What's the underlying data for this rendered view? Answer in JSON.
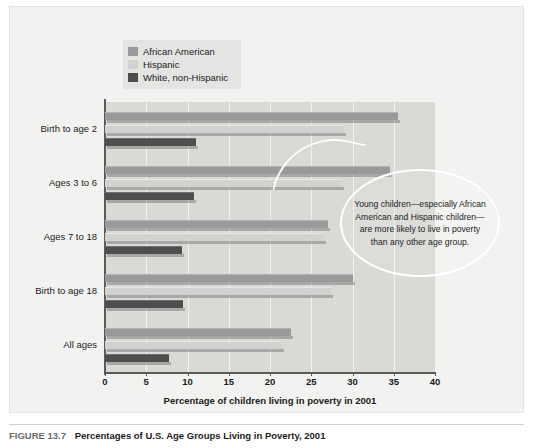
{
  "figure": {
    "caption_label": "FIGURE 13.7",
    "caption_text": "Percentages of U.S. Age Groups Living in Poverty, 2001"
  },
  "callout": {
    "text": "Young children—especially African American and Hispanic children—are more likely to live in poverty than any other age group."
  },
  "chart_data": {
    "type": "bar",
    "orientation": "horizontal",
    "title": "",
    "xlabel": "Percentage of children living in poverty in 2001",
    "ylabel": "",
    "xlim": [
      0,
      40
    ],
    "xticks": [
      0,
      5,
      10,
      15,
      20,
      25,
      30,
      35,
      40
    ],
    "grid": true,
    "legend_position": "top-left",
    "categories": [
      "Birth to age 2",
      "Ages 3 to 6",
      "Ages 7 to 18",
      "Birth to age 18",
      "All ages"
    ],
    "series": [
      {
        "name": "African American",
        "color": "#9a9a9a",
        "values": [
          35.5,
          34.5,
          27.0,
          30.0,
          22.6
        ]
      },
      {
        "name": "Hispanic",
        "color": "#d2d2d0",
        "values": [
          29.0,
          28.7,
          26.5,
          27.4,
          21.5
        ]
      },
      {
        "name": "White, non-Hispanic",
        "color": "#4e4e4e",
        "values": [
          11.0,
          10.8,
          9.3,
          9.5,
          7.7
        ]
      }
    ]
  }
}
